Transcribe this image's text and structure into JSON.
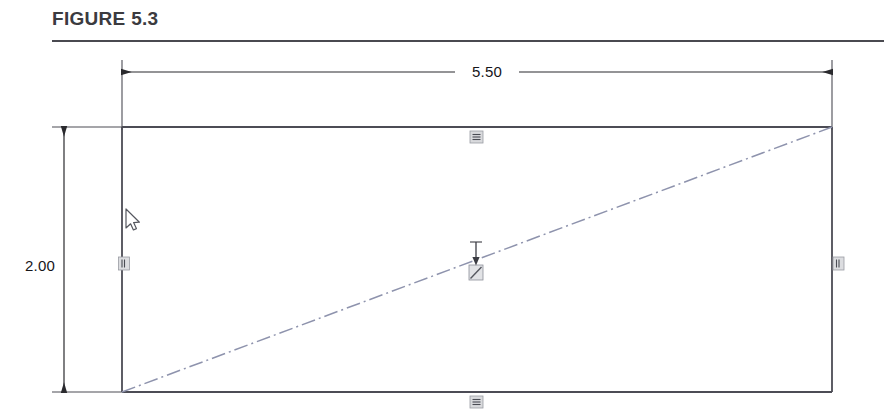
{
  "figure": {
    "title": "FIGURE 5.3",
    "caption_rule": "horizontal-rule"
  },
  "colors": {
    "title_text": "#3b3b3f",
    "rule": "#4a4a50",
    "geometry_line": "#4c4c55",
    "dimension_line": "#2a2a2e",
    "construction_line": "#8e93ad",
    "relation_marker": "#6f7280",
    "dimension_text": "#16161a"
  },
  "drawing": {
    "type": "cad-sketch",
    "description": "rectangle-with-diagonal-construction-line",
    "rectangle": {
      "name": "sketch-rectangle",
      "x": 122,
      "y": 81,
      "width": 710,
      "height": 265
    },
    "diagonal": {
      "name": "diagonal-construction-line",
      "style": "dash-dot",
      "x1": 122,
      "y1": 346,
      "x2": 832,
      "y2": 81
    },
    "dimensions": [
      {
        "name": "horizontal-dimension",
        "value": "5.50",
        "orientation": "horizontal",
        "line_y": 26,
        "start_x": 122,
        "end_x": 832,
        "text_x": 487,
        "text_y": 31
      },
      {
        "name": "vertical-dimension",
        "value": "2.00",
        "orientation": "vertical",
        "line_x": 64,
        "start_y": 81,
        "end_y": 346,
        "text_x": 40,
        "text_y": 225
      }
    ],
    "relation_markers": [
      {
        "name": "horizontal-relation-top",
        "kind": "horizontal",
        "x": 476,
        "y": 91
      },
      {
        "name": "horizontal-relation-bottom",
        "kind": "horizontal",
        "x": 476,
        "y": 356
      },
      {
        "name": "vertical-relation-left",
        "kind": "vertical",
        "x": 124,
        "y": 217
      },
      {
        "name": "vertical-relation-right",
        "kind": "vertical",
        "x": 838,
        "y": 217
      },
      {
        "name": "midpoint-relation-center",
        "kind": "midpoint",
        "x": 476,
        "y": 226
      }
    ],
    "pointer_arrow": {
      "name": "midpoint-pointer-arrow",
      "x": 476,
      "top_y": 196,
      "bottom_y": 219
    },
    "cursor": {
      "name": "mouse-cursor",
      "x": 126,
      "y": 170
    }
  }
}
